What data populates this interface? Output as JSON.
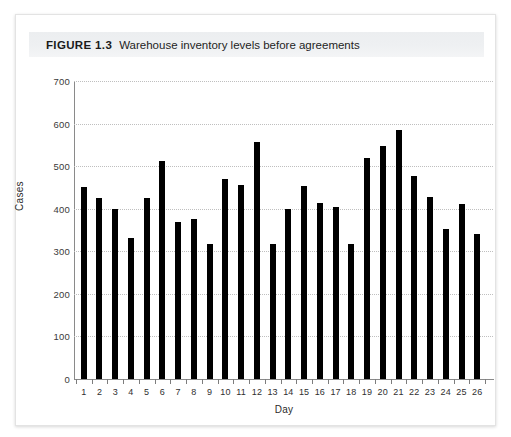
{
  "figure": {
    "label": "FIGURE 1.3",
    "caption": "Warehouse inventory levels before agreements"
  },
  "chart_data": {
    "type": "bar",
    "title": "Warehouse inventory levels before agreements",
    "xlabel": "Day",
    "ylabel": "Cases",
    "categories": [
      "1",
      "2",
      "3",
      "4",
      "5",
      "6",
      "7",
      "8",
      "9",
      "10",
      "11",
      "12",
      "13",
      "14",
      "15",
      "16",
      "17",
      "18",
      "19",
      "20",
      "21",
      "22",
      "23",
      "24",
      "25",
      "26"
    ],
    "values": [
      450,
      425,
      400,
      332,
      425,
      513,
      370,
      375,
      318,
      470,
      455,
      557,
      318,
      400,
      453,
      413,
      405,
      318,
      520,
      548,
      585,
      478,
      427,
      352,
      412,
      340
    ],
    "ylim": [
      0,
      700
    ],
    "ytick_labels": [
      "0",
      "100",
      "200",
      "300",
      "400",
      "500",
      "600",
      "700"
    ],
    "ytick_values": [
      0,
      100,
      200,
      300,
      400,
      500,
      600,
      700
    ],
    "grid": true,
    "legend": false,
    "bar_color": "#000000"
  }
}
